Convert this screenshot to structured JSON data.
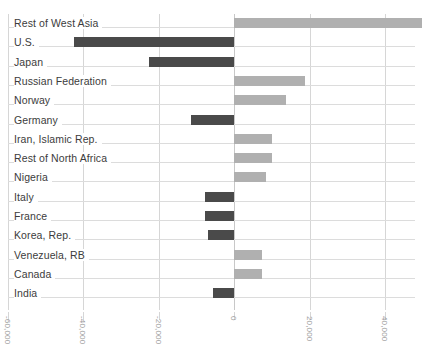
{
  "chart_data": {
    "type": "bar",
    "orientation": "horizontal",
    "title": "",
    "subtitle": "",
    "xlabel": "",
    "ylabel": "",
    "xlim": [
      -60000,
      50000
    ],
    "xticks": [
      -60000,
      -40000,
      -20000,
      0,
      20000,
      40000
    ],
    "xtick_labels": [
      "-60,000",
      "-40,000",
      "-20,000",
      "0",
      "20,000",
      "40,000"
    ],
    "grid": "vertical",
    "legend": "none",
    "colors": {
      "positive_bar": "#b0b0b0",
      "negative_bar": "#4a4a4a",
      "gridline": "#d6d6d6",
      "row_rule": "#dcdcdc",
      "label_text": "#3c3c3c",
      "tick_text": "#9a9a9a",
      "background": "#ffffff"
    },
    "categories": [
      "Rest of West Asia",
      "U.S.",
      "Japan",
      "Russian Federation",
      "Norway",
      "Germany",
      "Iran, Islamic Rep.",
      "Rest of North Africa",
      "Nigeria",
      "Italy",
      "France",
      "Korea, Rep.",
      "Venezuela, RB",
      "Canada",
      "India"
    ],
    "values": [
      49700,
      -42400,
      -22700,
      18600,
      13800,
      -11600,
      10000,
      10000,
      8400,
      -7800,
      -7800,
      -7000,
      7300,
      7300,
      -5700
    ]
  }
}
